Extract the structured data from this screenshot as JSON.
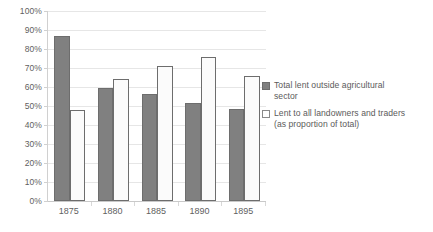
{
  "chart_data": {
    "type": "bar",
    "title": "",
    "subtitle": "",
    "xlabel": "",
    "ylabel": "",
    "categories": [
      "1875",
      "1880",
      "1885",
      "1890",
      "1895"
    ],
    "series": [
      {
        "name": "Total lent outside agricultural sector",
        "values": [
          87,
          59.5,
          56.5,
          51.5,
          48.5
        ],
        "color": "#808080",
        "border_color": "#6d6d6d"
      },
      {
        "name": "Lent to all landowners and traders (as proportion of total)",
        "values": [
          48,
          64,
          71,
          76,
          66
        ],
        "color": "#ffffff",
        "border_color": "#6d6d6d"
      }
    ],
    "ylim": [
      0,
      100
    ],
    "ytick_step": 10,
    "ytick_labels": [
      "0%",
      "10%",
      "20%",
      "30%",
      "40%",
      "50%",
      "60%",
      "70%",
      "80%",
      "90%",
      "100%"
    ],
    "ytick_values": [
      0,
      10,
      20,
      30,
      40,
      50,
      60,
      70,
      80,
      90,
      100
    ],
    "grid": true,
    "grid_axis": "y",
    "grid_color": "#e6e6e6",
    "legend_position": "right",
    "background_color": "#ffffff",
    "value_suffix": "%"
  },
  "legend": {
    "entries": [
      {
        "line1": "Total lent outside agricultural",
        "line2": "sector"
      },
      {
        "line1": "Lent to all landowners and traders",
        "line2": "(as proportion of total)"
      }
    ]
  }
}
